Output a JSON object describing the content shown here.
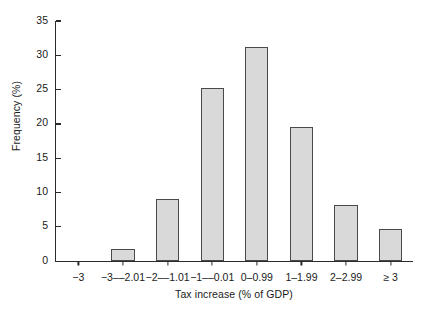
{
  "chart_data": {
    "type": "bar",
    "title": "",
    "xlabel": "Tax increase (% of GDP)",
    "ylabel": "Frequency (%)",
    "categories": [
      "−3",
      "−3––2.01",
      "−2––1.01",
      "−1––0.01",
      "0–0.99",
      "1–1.99",
      "2–2.99",
      "≥ 3"
    ],
    "values": [
      0,
      1.7,
      9.0,
      25.2,
      31.2,
      19.5,
      8.2,
      4.6
    ],
    "ylim": [
      0,
      35
    ],
    "yticks": [
      0,
      5,
      10,
      15,
      20,
      25,
      30,
      35
    ],
    "grid": false,
    "legend": null,
    "bar_fill_color": "#d9d9d9",
    "bar_edge_color": "#4a4a4a",
    "axis_color": "#2b2b2b"
  }
}
